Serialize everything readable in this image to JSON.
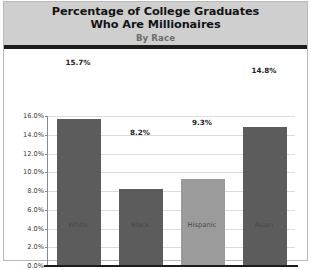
{
  "chart_data": {
    "type": "bar",
    "title": "Percentage of College Graduates\nWho Are Millionaires",
    "subtitle": "By Race",
    "categories": [
      "White",
      "Black",
      "Hispanic",
      "Asian"
    ],
    "values": [
      15.7,
      8.2,
      9.3,
      14.8
    ],
    "value_labels": [
      "15.7%",
      "8.2%",
      "9.3%",
      "14.8%"
    ],
    "bar_colors": [
      "#5c5c5c",
      "#5c5c5c",
      "#9b9b9b",
      "#5c5c5c"
    ],
    "xlabel": "",
    "ylabel": "",
    "ylim": [
      0,
      16
    ],
    "ytick_values": [
      0,
      2,
      4,
      6,
      8,
      10,
      12,
      14,
      16
    ],
    "ytick_labels": [
      "0.0%",
      "2.0%",
      "4.0%",
      "6.0%",
      "8.0%",
      "10.0%",
      "12.0%",
      "14.0%",
      "16.0%"
    ],
    "grid": true,
    "legend": "none"
  },
  "style": {
    "title_band_color": "#cfcfcf",
    "title_rule_color": "#1c1c1c",
    "plot_background": "#ffffff",
    "gridline_color": "#dcdcdc",
    "axis_color": "#8a8a8a"
  }
}
